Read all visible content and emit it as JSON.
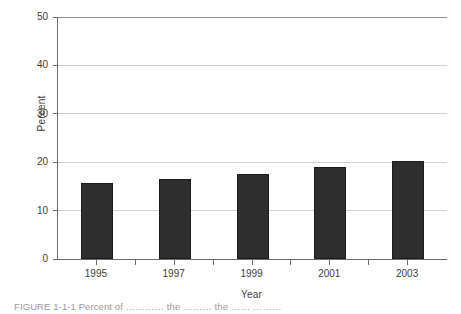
{
  "chart_data": {
    "type": "bar",
    "title": "",
    "xlabel": "Year",
    "ylabel": "Percent",
    "categories": [
      "1995",
      "1997",
      "1999",
      "2001",
      "2003"
    ],
    "values": [
      15.8,
      16.6,
      17.6,
      19.1,
      20.3
    ],
    "ylim": [
      0,
      50
    ],
    "yticks": [
      0,
      10,
      20,
      30,
      40,
      50
    ],
    "ytick_labels": [
      "0",
      "10",
      "20",
      "30",
      "40",
      "50"
    ],
    "grid": "horizontal",
    "legend": "none",
    "bar_color": "#2e2e2e",
    "gridline_color": "#cfcfcf",
    "axis_color": "#6d6d6d",
    "background": "#ffffff"
  },
  "caption": {
    "text": "FIGURE 1-1-1 Percent of ………… the ……… the …… ………"
  }
}
